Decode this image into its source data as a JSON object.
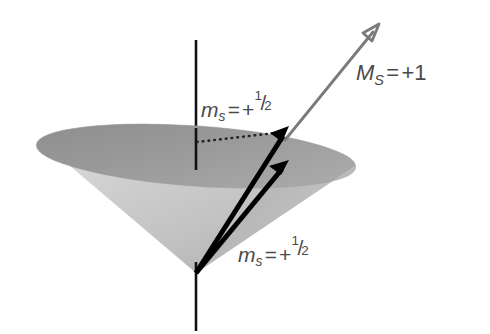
{
  "figure": {
    "name": "spin-vector-cone-diagram",
    "background_color": "#ffffff",
    "width": 490,
    "height": 334
  },
  "labels": {
    "ms_top": {
      "symbol": "m",
      "subscript": "s",
      "equals": "=",
      "sign": "+",
      "numerator": "1",
      "slash": "/",
      "denominator": "2",
      "full_text": "m_s = +1/2"
    },
    "ms_bottom": {
      "symbol": "m",
      "subscript": "s",
      "equals": "=",
      "sign": "+",
      "numerator": "1",
      "slash": "/",
      "denominator": "2",
      "full_text": "m_s = +1/2"
    },
    "MS_resultant": {
      "symbol": "M",
      "subscript": "S",
      "equals": "=",
      "value": "+1",
      "full_text": "M_S = +1"
    }
  },
  "colors": {
    "background": "#ffffff",
    "label_text": "#4a4a4a",
    "axis_line": "#111111",
    "spin_arrow": "#000000",
    "resultant_arrow": "#7a7a7a",
    "dotted_line": "#222222",
    "cone_interior_dark": "#9a9a9a",
    "cone_interior_mid": "#8e8e8e",
    "cone_surface_light": "#cfcfcf",
    "cone_surface_mid": "#bdbdbd",
    "cone_surface_shadow": "#a6a6a6"
  },
  "geometry": {
    "axis": {
      "x": 196,
      "y_top": 40,
      "y_bottom": 331
    },
    "cone_apex": {
      "x": 196,
      "y": 273
    },
    "cone_rim_ellipse": {
      "center_x": 196,
      "center_y": 156,
      "radius_x": 160,
      "radius_y": 30,
      "tilt_degrees": 4
    },
    "spin_arrow_upper": {
      "x1": 196,
      "y1": 273,
      "x2": 288,
      "y2": 129
    },
    "spin_arrow_lower": {
      "x1": 196,
      "y1": 273,
      "x2": 288,
      "y2": 162
    },
    "resultant_arrow": {
      "x1": 285,
      "y1": 140,
      "x2": 379,
      "y2": 25
    },
    "dotted_line": {
      "x1": 197,
      "y1": 142,
      "x2": 284,
      "y2": 132
    }
  }
}
